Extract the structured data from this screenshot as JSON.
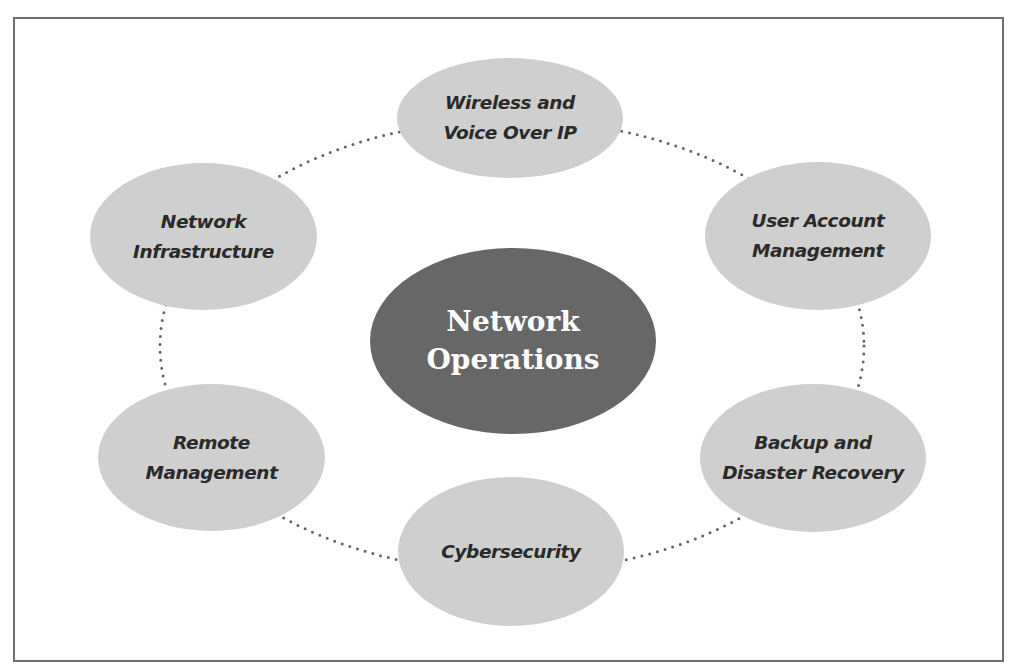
{
  "diagram": {
    "type": "hub-and-spoke",
    "colors": {
      "border": "#6e6e6e",
      "center_fill": "#676767",
      "center_text": "#ffffff",
      "node_fill": "#cfcfcf",
      "node_text": "#2a2a2a",
      "connector": "#666666"
    },
    "center": {
      "lines": [
        "Network",
        "Operations"
      ]
    },
    "nodes": [
      {
        "id": "wireless",
        "lines": [
          "Wireless and",
          "Voice Over IP"
        ]
      },
      {
        "id": "user-account",
        "lines": [
          "User Account",
          "Management"
        ]
      },
      {
        "id": "backup",
        "lines": [
          "Backup and",
          "Disaster Recovery"
        ]
      },
      {
        "id": "cybersecurity",
        "lines": [
          "Cybersecurity"
        ]
      },
      {
        "id": "remote",
        "lines": [
          "Remote",
          "Management"
        ]
      },
      {
        "id": "infrastructure",
        "lines": [
          "Network",
          "Infrastructure"
        ]
      }
    ],
    "connector_style": "dotted ellipse ring linking all outer nodes"
  }
}
